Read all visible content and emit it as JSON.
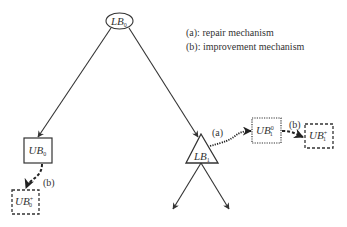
{
  "legend": {
    "a": "(a): repair mechanism",
    "b": "(b): improvement mechanism"
  },
  "nodes": {
    "root": {
      "base": "LB",
      "sub": "0",
      "shape": "ellipse"
    },
    "ub0": {
      "base": "UB",
      "sub": "0",
      "shape": "solid-rect"
    },
    "ub0_plus": {
      "base": "UB",
      "sub": "0",
      "sup": "+",
      "shape": "dashed-rect"
    },
    "lb1": {
      "base": "LB",
      "sub": "1",
      "shape": "triangle"
    },
    "ub1_0": {
      "base": "UB",
      "sub": "1",
      "sup": "0",
      "shape": "dotted-rect"
    },
    "ub1_plus": {
      "base": "UB",
      "sub": "1",
      "sup": "+",
      "shape": "dashed-rect"
    }
  },
  "edge_labels": {
    "repair": "(a)",
    "improve_lb1": "(b)",
    "improve_ub0": "(b)"
  },
  "colors": {
    "stroke": "#333333",
    "background": "#ffffff"
  }
}
